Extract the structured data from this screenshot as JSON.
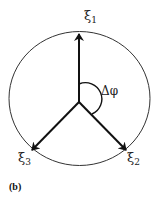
{
  "figure": {
    "panel_label": "(b)",
    "angle_label": "Δφ",
    "vectors": [
      {
        "symbol": "ξ",
        "index": "1"
      },
      {
        "symbol": "ξ",
        "index": "2"
      },
      {
        "symbol": "ξ",
        "index": "3"
      }
    ],
    "colors": {
      "stroke": "#111111",
      "circle": "#333333",
      "background": "#ffffff"
    }
  }
}
